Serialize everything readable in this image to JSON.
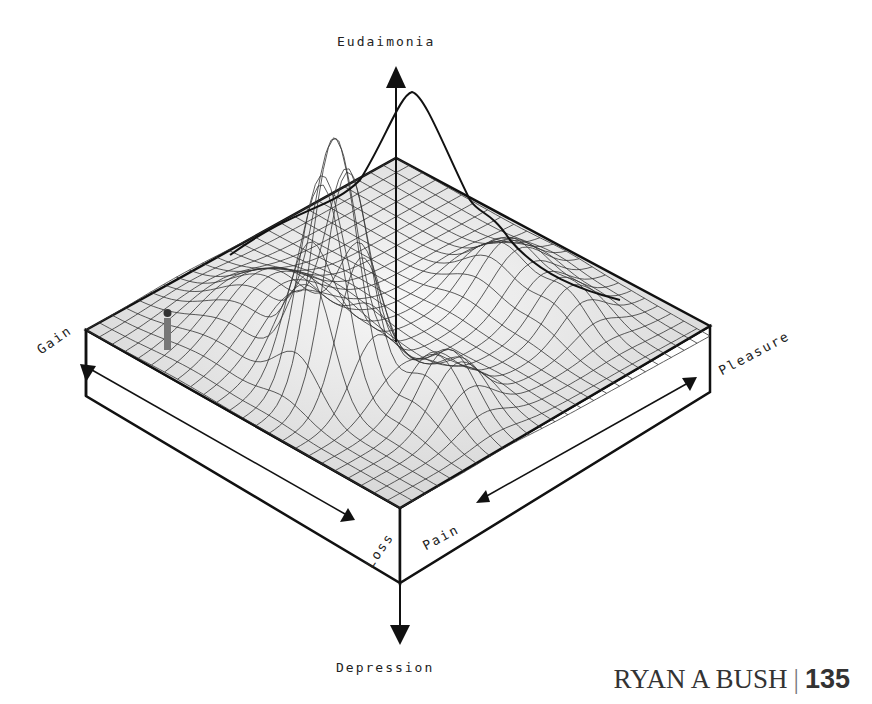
{
  "diagram": {
    "axes": {
      "up": "Eudaimonia",
      "down": "Depression",
      "left_top": "Gain",
      "left_bottom": "Loss",
      "right_bottom": "Pain",
      "right_top": "Pleasure"
    },
    "elements": [
      "3D wireframe surface with central peak",
      "small human figure",
      "isometric base block",
      "axis arrows"
    ]
  },
  "footer": {
    "author": "RYAN A BUSH",
    "separator": "|",
    "page_number": "135"
  },
  "colors": {
    "ink": "#111111",
    "surface_fill": "#e9e9e9",
    "background": "#ffffff"
  }
}
